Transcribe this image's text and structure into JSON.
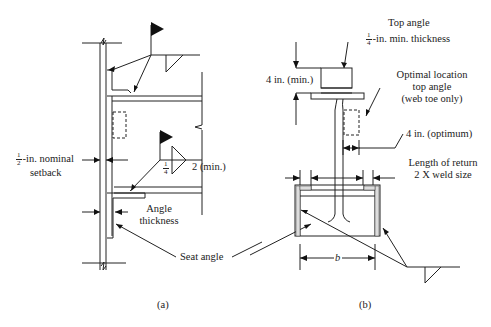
{
  "figure": {
    "panel_a": {
      "caption": "(a)",
      "labels": {
        "setback_fraction_num": "1",
        "setback_fraction_den": "2",
        "setback_line1": "-in. nominal",
        "setback_line2": "setback",
        "weld_fraction_num": "1",
        "weld_fraction_den": "4",
        "weld_length": "2 (min.)",
        "angle_thickness_line1": "Angle",
        "angle_thickness_line2": "thickness",
        "seat_angle": "Seat angle"
      }
    },
    "panel_b": {
      "caption": "(b)",
      "labels": {
        "top_angle": "Top angle",
        "thickness_fraction_num": "1",
        "thickness_fraction_den": "4",
        "thickness_text": "-in. min. thickness",
        "four_in_min": "4 in. (min.)",
        "optimal_line1": "Optimal location",
        "optimal_line2": "top angle",
        "optimal_line3": "(web toe only)",
        "four_in_optimum": "4 in. (optimum)",
        "return_line1": "Length of return",
        "return_line2": "2 X weld size",
        "dimension_b": "b"
      }
    }
  }
}
